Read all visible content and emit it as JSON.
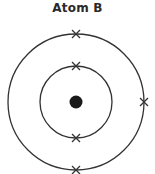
{
  "diagram": {
    "title": "Atom B",
    "type": "bohr-model",
    "nucleus": {
      "label": "nucleus",
      "color": "#1a1a1a"
    },
    "shells": [
      {
        "name": "inner-shell",
        "electrons": 2,
        "electron_positions": [
          "top",
          "bottom"
        ]
      },
      {
        "name": "outer-shell",
        "electrons": 3,
        "electron_positions": [
          "top",
          "right",
          "bottom"
        ]
      }
    ],
    "electron_marker": "x",
    "line_color": "#333333"
  }
}
